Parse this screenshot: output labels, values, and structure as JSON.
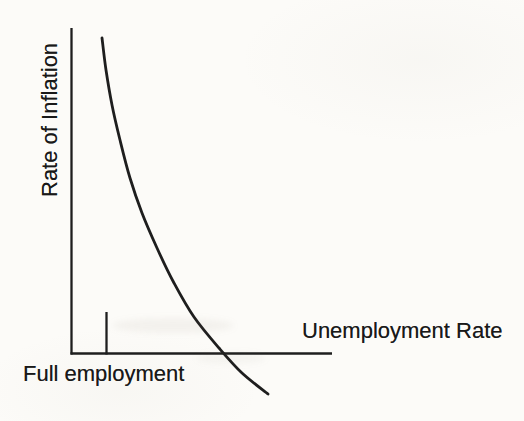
{
  "page": {
    "paper_color": "#fcfbf8",
    "ink_color": "#1e1e1e",
    "text_color": "#191919"
  },
  "figure": {
    "y_axis_label": "Rate of Inflation",
    "x_axis_label": "Unemployment Rate",
    "full_employment_label": "Full employment"
  },
  "chart_data": {
    "type": "line",
    "title": "",
    "xlabel": "Unemployment Rate",
    "ylabel": "Rate of Inflation",
    "numeric_axes": false,
    "grid": false,
    "legend": false,
    "annotations": [
      {
        "label": "Full employment",
        "kind": "tick-on-x-axis"
      }
    ],
    "axes_px": {
      "origin": [
        71.5,
        353.5
      ],
      "x_axis_end": [
        332,
        353.5
      ],
      "y_axis_top": [
        71.5,
        28
      ],
      "tick_x": 106.5,
      "tick_top_y": 312
    },
    "series": [
      {
        "name": "Phillips curve",
        "points_px": [
          [
            102,
            38
          ],
          [
            106,
            70
          ],
          [
            112,
            105
          ],
          [
            120,
            140
          ],
          [
            130,
            178
          ],
          [
            142,
            213
          ],
          [
            157,
            248
          ],
          [
            174,
            283
          ],
          [
            194,
            317
          ],
          [
            219,
            348
          ],
          [
            242,
            373
          ],
          [
            268,
            394
          ]
        ]
      }
    ]
  }
}
